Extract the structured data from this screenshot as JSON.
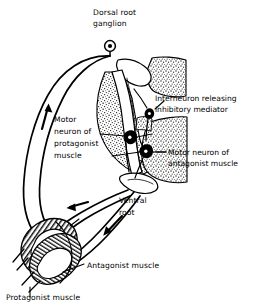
{
  "figure": {
    "background_color": "#ffffff",
    "ink_color": "#000000",
    "labels": {
      "dorsal_root_ganglion": {
        "line1": "Dorsal root",
        "line2": "ganglion"
      },
      "interneuron": {
        "line1": "Interneuron releasing",
        "line2": "inhibitory mediator"
      },
      "motor_neuron_protagonist": {
        "line1": "Motor",
        "line2": "neuron of",
        "line3": "protagonist",
        "line4": "muscle"
      },
      "motor_neuron_antagonist": {
        "line1": "Motor neuron of",
        "line2": "antagonist muscle"
      },
      "ventral_root": {
        "line1": "Ventral",
        "line2": "root"
      },
      "antagonist_muscle": {
        "line1": "Antagonist muscle"
      },
      "protagonist_muscle": {
        "line1": "Protagonist muscle"
      }
    },
    "structures": [
      {
        "name": "dorsal-root-ganglion",
        "kind": "ganglion-cell-body"
      },
      {
        "name": "spinal-cord-gray-matter",
        "kind": "stippled-butterfly"
      },
      {
        "name": "dorsal-root-nerve",
        "kind": "white-band"
      },
      {
        "name": "ventral-root-nerve",
        "kind": "white-band"
      },
      {
        "name": "interneuron-cell-body",
        "kind": "filled-neuron"
      },
      {
        "name": "motor-neuron-protagonist-cell-body",
        "kind": "filled-neuron"
      },
      {
        "name": "motor-neuron-antagonist-cell-body",
        "kind": "filled-neuron"
      },
      {
        "name": "protagonist-muscle-belly",
        "kind": "striated-muscle"
      },
      {
        "name": "antagonist-muscle-belly",
        "kind": "striated-muscle"
      }
    ],
    "arrows": [
      {
        "name": "afferent-arrow",
        "direction": "up",
        "pathway": "sensory toward ganglion"
      },
      {
        "name": "efferent-arrow-protagonist",
        "direction": "left",
        "pathway": "ventral root toward protagonist muscle"
      },
      {
        "name": "efferent-arrow-antagonist",
        "direction": "down-left",
        "pathway": "ventral root toward antagonist muscle"
      }
    ]
  }
}
